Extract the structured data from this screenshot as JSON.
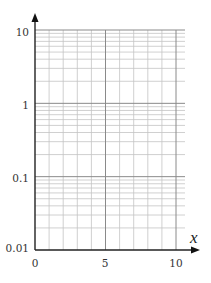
{
  "chart_data": {
    "type": "line",
    "title": "",
    "subtitle": "",
    "xlabel": "x",
    "ylabel": "",
    "xscale": "linear",
    "yscale": "log",
    "xlim": [
      0,
      10
    ],
    "ylim": [
      0.01,
      10
    ],
    "x_ticks": [
      0,
      5,
      10
    ],
    "x_tick_labels": [
      "0",
      "5",
      "10"
    ],
    "y_ticks": [
      0.01,
      0.1,
      1,
      10
    ],
    "y_tick_labels": [
      "0.01",
      "0.1",
      "1",
      "10"
    ],
    "x_minor_grid_step": 1,
    "y_minor_grid": "log subdivisions 2-9 per decade",
    "grid": true,
    "legend": null,
    "series": []
  },
  "colors": {
    "axis": "#222222",
    "major_grid": "#8a8a8a",
    "minor_grid": "#c4c4c4",
    "background": "#ffffff"
  }
}
